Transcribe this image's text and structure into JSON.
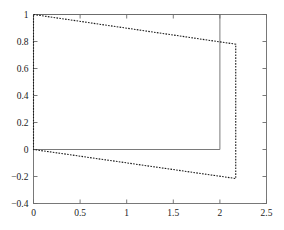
{
  "chart_data": {
    "type": "line",
    "title": "",
    "xlabel": "",
    "ylabel": "",
    "xlim": [
      0,
      2.5
    ],
    "ylim": [
      -0.4,
      1.0
    ],
    "grid": false,
    "legend": null,
    "xticks": [
      0,
      0.5,
      1,
      1.5,
      2,
      2.5
    ],
    "xticklabels": [
      "0",
      "0.5",
      "1",
      "1.5",
      "2",
      "2.5"
    ],
    "yticks": [
      -0.4,
      -0.2,
      0,
      0.2,
      0.4,
      0.6,
      0.8,
      1
    ],
    "yticklabels": [
      "-0.4",
      "-0.2",
      "0",
      "0.2",
      "0.4",
      "0.6",
      "0.8",
      "1"
    ],
    "series": [
      {
        "name": "reference-rectangle",
        "style": "solid",
        "color": "#6b6b6b",
        "linewidth": 0.9,
        "points": [
          [
            0,
            1
          ],
          [
            0,
            0
          ],
          [
            2,
            0
          ],
          [
            2,
            1
          ],
          [
            0,
            1
          ]
        ]
      },
      {
        "name": "sheared-rectangle",
        "style": "dashed",
        "color": "#1a1a1a",
        "linewidth": 1.1,
        "points": [
          [
            0,
            1
          ],
          [
            2.17,
            0.78
          ],
          [
            2.17,
            -0.215
          ],
          [
            0,
            0
          ],
          [
            0,
            1
          ]
        ]
      }
    ],
    "axes": {
      "frame_color": "#6b6b6b",
      "tick_direction": "in",
      "background": "#ffffff"
    }
  },
  "figure": {
    "background_color": "#ffffff",
    "axis_color": "#6b6b6b",
    "text_color": "#1a1a1a"
  }
}
